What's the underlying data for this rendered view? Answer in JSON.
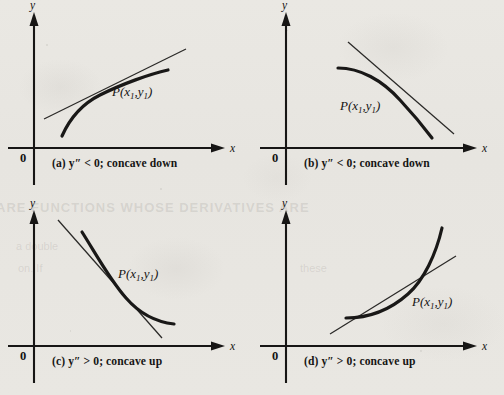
{
  "figure": {
    "background_color": "#e8e6e1",
    "ink_color": "#171615"
  },
  "axes": {
    "x_label": "x",
    "y_label": "y",
    "origin_label": "0"
  },
  "panels": [
    {
      "id": "a",
      "caption": "(a)  y″ < 0; concave down",
      "point_label_p": "P(x",
      "point_label_sub1": "1",
      "point_label_mid": ",y",
      "point_label_sub2": "1",
      "point_label_close": ")",
      "curve_direction": "increasing",
      "concavity": "down",
      "second_derivative": "negative",
      "tangent_position": "above curve"
    },
    {
      "id": "b",
      "caption": "(b)  y″ < 0; concave down",
      "point_label_p": "P(x",
      "point_label_sub1": "1",
      "point_label_mid": ",y",
      "point_label_sub2": "1",
      "point_label_close": ")",
      "curve_direction": "decreasing",
      "concavity": "down",
      "second_derivative": "negative",
      "tangent_position": "above curve"
    },
    {
      "id": "c",
      "caption": "(c)  y″ > 0; concave up",
      "point_label_p": "P(x",
      "point_label_sub1": "1",
      "point_label_mid": ",y",
      "point_label_sub2": "1",
      "point_label_close": ")",
      "curve_direction": "decreasing",
      "concavity": "up",
      "second_derivative": "positive",
      "tangent_position": "below curve"
    },
    {
      "id": "d",
      "caption": "(d)  y″ > 0; concave up",
      "point_label_p": "P(x",
      "point_label_sub1": "1",
      "point_label_mid": ",y",
      "point_label_sub2": "1",
      "point_label_close": ")",
      "curve_direction": "increasing",
      "concavity": "up",
      "second_derivative": "positive",
      "tangent_position": "below curve"
    }
  ],
  "bleed_through": {
    "line1": "ARE FUNCTIONS WHOSE DERIVATIVES ARE",
    "line2": "a double",
    "line3": "on. If",
    "line4": "these"
  }
}
